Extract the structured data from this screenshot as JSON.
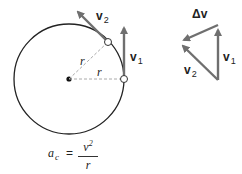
{
  "diagram": {
    "circle_diagram": {
      "radius_label_1": "r",
      "radius_label_2": "r",
      "v1_label": "v",
      "v1_sub": "1",
      "v2_label": "v",
      "v2_sub": "2"
    },
    "vector_triangle": {
      "delta_v_label": "Δv",
      "v1_label": "v",
      "v1_sub": "1",
      "v2_label": "v",
      "v2_sub": "2"
    },
    "formula": {
      "lhs": "a",
      "lhs_sub": "c",
      "equals": "=",
      "numerator": "v",
      "numerator_sup": "2",
      "denominator": "r"
    },
    "colors": {
      "circle": "#222222",
      "vector": "#6f6f6f",
      "dashed": "#aaaaaa",
      "text": "#222222"
    }
  }
}
